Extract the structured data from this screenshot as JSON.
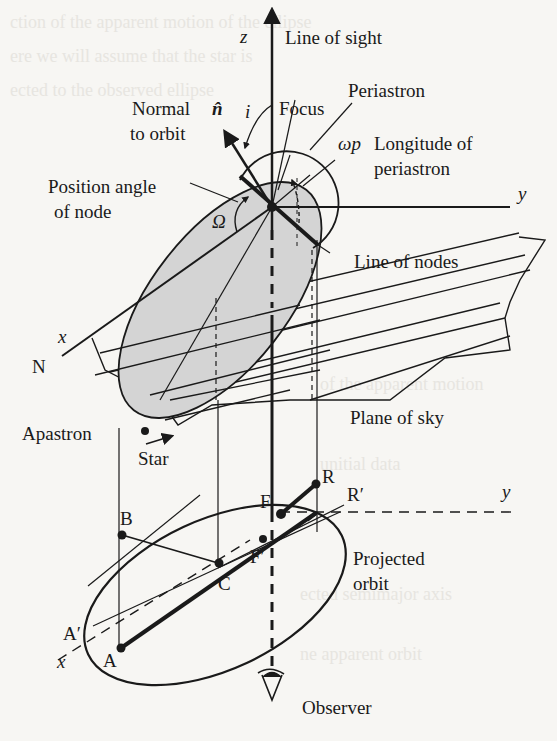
{
  "figure": {
    "labels": {
      "z_axis": "z",
      "line_of_sight": "Line of sight",
      "normal_line1": "Normal",
      "normal_line2": "to orbit",
      "normal_symbol": "n̂",
      "inclination": "i",
      "focus": "Focus",
      "periastron": "Periastron",
      "omega_p": "ωp",
      "longitude_line1": "Longitude of",
      "longitude_line2": "periastron",
      "position_angle_line1": "Position angle",
      "position_angle_line2": "of node",
      "big_omega": "Ω",
      "y_axis_top": "y",
      "line_of_nodes": "Line of nodes",
      "x_axis_top": "x",
      "north": "N",
      "plane_of_sky": "Plane of sky",
      "apastron": "Apastron",
      "star": "Star",
      "point_R": "R",
      "point_R_prime": "R′",
      "y_axis_bottom": "y",
      "point_F": "F",
      "point_B": "B",
      "point_F_prime": "F′",
      "projected_line1": "Projected",
      "projected_line2": "orbit",
      "point_C": "C",
      "point_A_prime": "A′",
      "x_axis_bottom": "x",
      "point_A": "A",
      "observer": "Observer"
    },
    "colors": {
      "ink": "#1a1a1a",
      "orbit_fill": "#d4d4d4",
      "paper": "#f7f6f3"
    }
  }
}
